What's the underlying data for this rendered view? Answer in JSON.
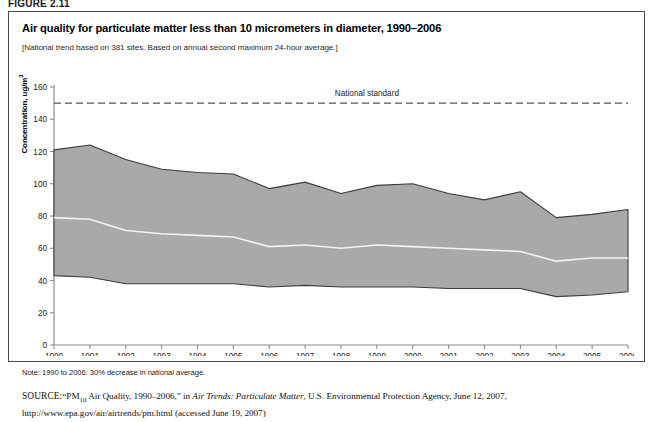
{
  "figure": {
    "label": "FIGURE 2.11",
    "title": "Air quality for particulate matter less than 10 micrometers in diameter, 1990–2006",
    "subtitle": "[National trend based on 381 sites. Based on annual second maximum 24-hour average.]",
    "note": "Note: 1990 to 2006: 30% decrease in national average.",
    "source_prefix": "SOURCE:",
    "source_quote": "“PM",
    "source_sub": "10",
    "source_quote_rest": " Air Quality, 1990–2006,” in ",
    "source_italic": "Air Trends: Particulate Matter",
    "source_rest": ", U.S. Environmental Protection Agency, June 12, 2007, http://www.epa.gov/air/airtrends/pm.html (accessed June 19, 2007)"
  },
  "colors": {
    "band_fill": "#a9a9a9",
    "band_edge": "#3c3c3c",
    "mean_line": "#f2f2f2",
    "axis": "#8c8c8c",
    "standard_line": "#555555",
    "frame": "#4a4a4a"
  },
  "chart_data": {
    "type": "area",
    "title": "Air quality for particulate matter less than 10 micrometers in diameter, 1990–2006",
    "xlabel": "",
    "ylabel": "Concentration, ug/m³",
    "xlim": [
      1990,
      2006
    ],
    "ylim": [
      0,
      160
    ],
    "ytick_step": 20,
    "yticks": [
      0,
      20,
      40,
      60,
      80,
      100,
      120,
      140,
      160
    ],
    "x": [
      1990,
      1991,
      1992,
      1993,
      1994,
      1995,
      1996,
      1997,
      1998,
      1999,
      2000,
      2001,
      2002,
      2003,
      2004,
      2005,
      2006
    ],
    "xticklabels": [
      "1990",
      "1991",
      "1992",
      "1993",
      "1994",
      "1995",
      "1996",
      "1997",
      "1998",
      "1999",
      "2000",
      "2001",
      "2002",
      "2003",
      "2004",
      "2005",
      "2006"
    ],
    "grid": false,
    "legend": "none",
    "annotations": [
      {
        "text": "National standard",
        "y": 150,
        "x": 1999,
        "style": "dashed-line-label"
      }
    ],
    "series": [
      {
        "name": "90th percentile",
        "role": "band_upper",
        "values": [
          121,
          124,
          115,
          109,
          107,
          106,
          97,
          101,
          94,
          99,
          100,
          94,
          90,
          95,
          79,
          81,
          84
        ]
      },
      {
        "name": "Mean (national average)",
        "role": "mean_line",
        "values": [
          79,
          78,
          71,
          69,
          68,
          67,
          61,
          62,
          60,
          62,
          61,
          60,
          59,
          58,
          52,
          54,
          54
        ]
      },
      {
        "name": "10th percentile",
        "role": "band_lower",
        "values": [
          43,
          42,
          38,
          38,
          38,
          38,
          36,
          37,
          36,
          36,
          36,
          35,
          35,
          35,
          30,
          31,
          33
        ]
      },
      {
        "name": "National standard",
        "role": "reference_line",
        "values": [
          150,
          150,
          150,
          150,
          150,
          150,
          150,
          150,
          150,
          150,
          150,
          150,
          150,
          150,
          150,
          150,
          150
        ]
      }
    ]
  }
}
